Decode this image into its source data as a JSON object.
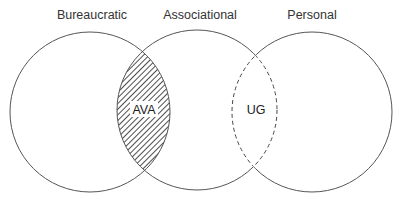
{
  "diagram": {
    "type": "venn",
    "sets": [
      {
        "label": "Bureaucratic"
      },
      {
        "label": "Associational"
      },
      {
        "label": "Personal"
      }
    ],
    "regions": [
      {
        "label": "AVA",
        "between": [
          "Bureaucratic",
          "Associational"
        ],
        "style": "hatched"
      },
      {
        "label": "UG",
        "between": [
          "Associational",
          "Personal"
        ],
        "style": "dashed"
      }
    ]
  }
}
